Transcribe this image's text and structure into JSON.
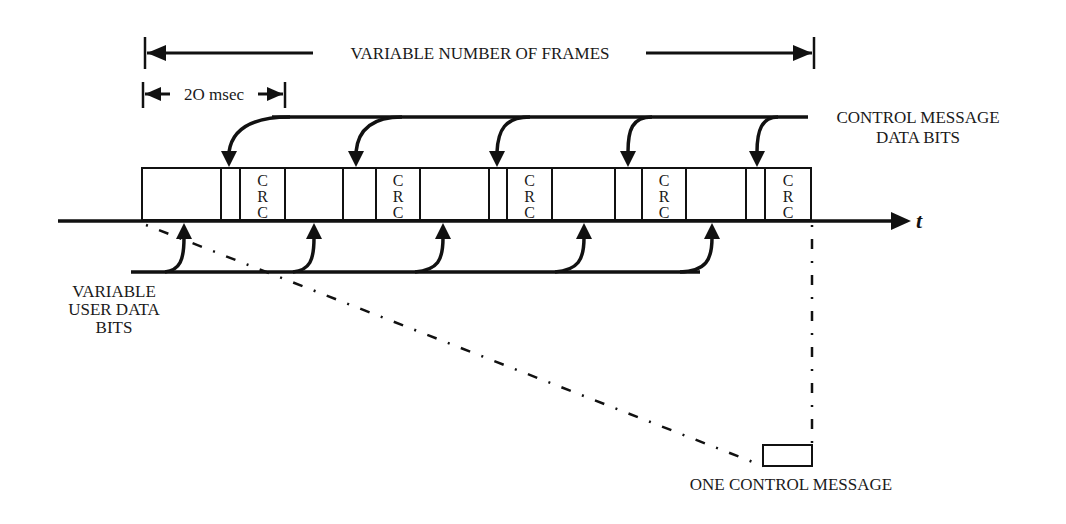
{
  "title_span": {
    "label": "VARIABLE NUMBER OF FRAMES"
  },
  "frame_duration": {
    "label": "2O msec"
  },
  "control_input": {
    "line1": "CONTROL MESSAGE",
    "line2": "DATA BITS"
  },
  "user_input": {
    "line1": "VARIABLE",
    "line2": "USER DATA",
    "line3": "BITS"
  },
  "time_axis": {
    "label": "t"
  },
  "control_message_box": {
    "label": "ONE CONTROL MESSAGE"
  },
  "frames": [
    {
      "index": 1,
      "crc": [
        "C",
        "R",
        "C"
      ]
    },
    {
      "index": 2,
      "crc": [
        "C",
        "R",
        "C"
      ]
    },
    {
      "index": 3,
      "crc": [
        "C",
        "R",
        "C"
      ]
    },
    {
      "index": 4,
      "crc": [
        "C",
        "R",
        "C"
      ]
    },
    {
      "index": 5,
      "crc": [
        "C",
        "R",
        "C"
      ]
    }
  ],
  "colors": {
    "ink": "#111111",
    "background": "#ffffff"
  }
}
